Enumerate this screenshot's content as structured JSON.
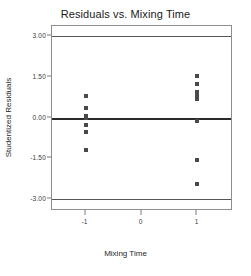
{
  "chart_data": {
    "type": "scatter",
    "title": "Residuals vs. Mixing Time",
    "xlabel": "Mixing Time",
    "ylabel": "Studentized Residuals",
    "xlim": [
      -1.6,
      1.6
    ],
    "ylim": [
      -3.35,
      3.35
    ],
    "grid": false,
    "legend": null,
    "x_ticks": [
      {
        "value": -1,
        "label": "-1"
      },
      {
        "value": 0,
        "label": "0"
      },
      {
        "value": 1,
        "label": "1"
      }
    ],
    "y_ticks": [
      {
        "value": 3.0,
        "label": "3.00"
      },
      {
        "value": 1.5,
        "label": "1.50"
      },
      {
        "value": 0.0,
        "label": "0.00"
      },
      {
        "value": -1.5,
        "label": "-1.50"
      },
      {
        "value": -3.0,
        "label": "-3.00"
      }
    ],
    "reference_lines": [
      {
        "value": 3.0,
        "style": "solid",
        "weight": "thin"
      },
      {
        "value": 0.0,
        "style": "solid",
        "weight": "thick"
      },
      {
        "value": -3.0,
        "style": "solid",
        "weight": "thin"
      }
    ],
    "points": [
      {
        "x": -1,
        "y": 0.77
      },
      {
        "x": -1,
        "y": 0.33
      },
      {
        "x": -1,
        "y": 0.04
      },
      {
        "x": -1,
        "y": -0.02
      },
      {
        "x": -1,
        "y": -0.29
      },
      {
        "x": -1,
        "y": -0.53
      },
      {
        "x": -1,
        "y": -1.18
      },
      {
        "x": 1,
        "y": 1.53
      },
      {
        "x": 1,
        "y": 1.24
      },
      {
        "x": 1,
        "y": 0.95
      },
      {
        "x": 1,
        "y": 0.84
      },
      {
        "x": 1,
        "y": 0.75
      },
      {
        "x": 1,
        "y": 0.66
      },
      {
        "x": 1,
        "y": -0.13
      },
      {
        "x": 1,
        "y": -1.55
      },
      {
        "x": 1,
        "y": -2.42
      }
    ],
    "colors": {
      "marker": "#4a4a4a",
      "frame": "#8d8d8d",
      "zero_line": "#2a2a2a",
      "limit_line": "#555555",
      "text": "#1f1f1f",
      "background": "#ffffff"
    }
  }
}
